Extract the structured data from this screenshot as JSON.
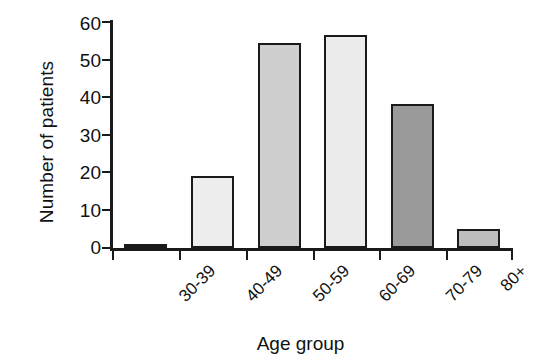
{
  "chart_data": {
    "type": "bar",
    "title": "",
    "xlabel": "Age group",
    "ylabel": "Number of patients",
    "categories": [
      "30-39",
      "40-49",
      "50-59",
      "60-69",
      "70-79",
      "80+"
    ],
    "values": [
      1,
      19,
      54,
      56,
      38,
      5
    ],
    "ylim": [
      0,
      60
    ],
    "yticks": [
      0,
      10,
      20,
      30,
      40,
      50,
      60
    ],
    "ytick_labels": [
      "0",
      "10",
      "20",
      "30",
      "40",
      "50",
      "60"
    ],
    "grid": false,
    "legend": null,
    "bar_colors": [
      "#3b3b3b",
      "#ededed",
      "#cfcfcf",
      "#ececec",
      "#9a9a9a",
      "#bdbdbd"
    ],
    "bar_edge_color": "#1a1a1a",
    "background": "#ffffff"
  }
}
